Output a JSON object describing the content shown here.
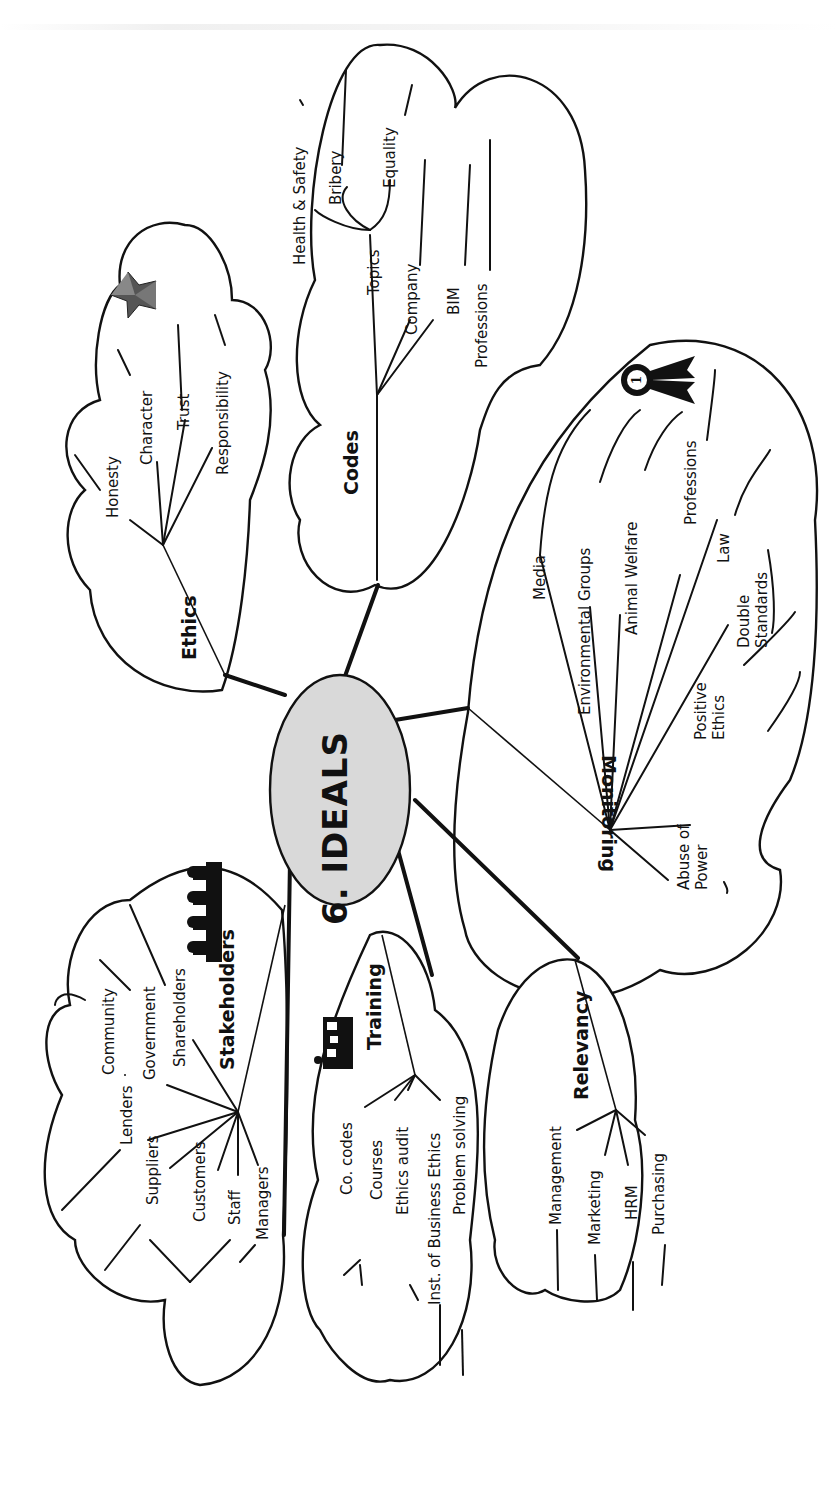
{
  "center": {
    "label": "6. IDEALS",
    "fill": "#d9d9d9"
  },
  "branches": {
    "ethics": {
      "label": "Ethics",
      "icon": "star-icon",
      "items": [
        "Honesty",
        "Character",
        "Trust",
        "Responsibility"
      ]
    },
    "codes": {
      "label": "Codes",
      "items": [
        "Topics",
        "Company",
        "BIM",
        "Professions"
      ],
      "topics_sub": [
        "Health & Safety",
        "Bribery",
        "Equality"
      ]
    },
    "monitoring": {
      "label": "Monitoring",
      "icon": "first-place-rosette-icon",
      "icon_text": "1",
      "items": [
        "Media",
        "Environmental Groups",
        "Animal Welfare",
        "Professions",
        "Law",
        "Double Standards",
        "Positive Ethics",
        "Abuse of Power"
      ]
    },
    "stakeholders": {
      "label": "Stakeholders",
      "icon": "people-group-icon",
      "items": [
        "Community",
        "Government",
        "Shareholders",
        "Lenders",
        "Suppliers",
        "Customers",
        "Staff",
        "Managers"
      ]
    },
    "training": {
      "label": "Training",
      "icon": "classroom-icon",
      "items": [
        "Co. codes",
        "Courses",
        "Ethics audit",
        "Inst. of Business Ethics",
        "Problem solving"
      ]
    },
    "relevancy": {
      "label": "Relevancy",
      "items": [
        "Management",
        "Marketing",
        "HRM",
        "Purchasing"
      ]
    }
  }
}
